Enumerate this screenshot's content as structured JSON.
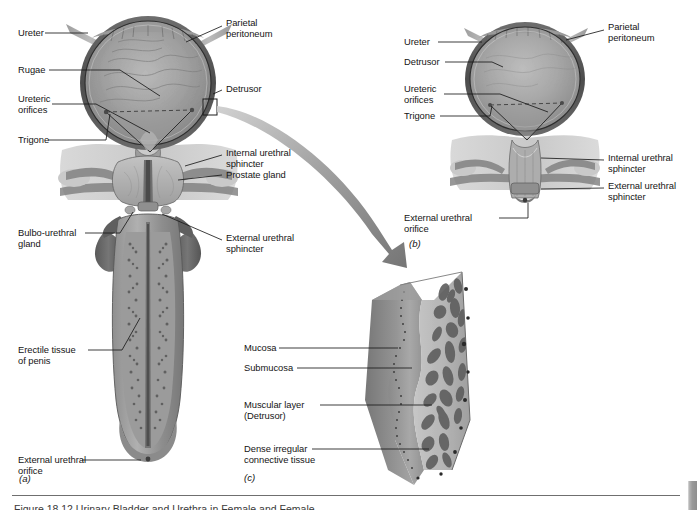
{
  "figure": {
    "background_color": "#ffffff",
    "ink_color": "#151515",
    "leader_color": "#1b1b1b",
    "arrow_color": "#8c8c8c"
  },
  "panel_a": {
    "letter": "(a)",
    "description": "Male urinary bladder with prostate gland and longitudinal section of penis",
    "labels_left": [
      {
        "id": "ureter",
        "text": "Ureter"
      },
      {
        "id": "rugae",
        "text": "Rugae"
      },
      {
        "id": "ureteric-orifices",
        "text": "Ureteric\norifices"
      },
      {
        "id": "trigone",
        "text": "Trigone"
      },
      {
        "id": "bulbo-urethral-gland",
        "text": "Bulbo-urethral\ngland"
      },
      {
        "id": "erectile-tissue",
        "text": "Erectile tissue\nof penis"
      },
      {
        "id": "external-urethral-orifice",
        "text": "External urethral\norifice"
      }
    ],
    "labels_right": [
      {
        "id": "parietal-peritoneum",
        "text": "Parietal\nperitoneum"
      },
      {
        "id": "detrusor",
        "text": "Detrusor"
      },
      {
        "id": "internal-urethral-sphincter",
        "text": "Internal urethral\nsphincter"
      },
      {
        "id": "prostate-gland",
        "text": "Prostate gland"
      },
      {
        "id": "external-urethral-sphincter",
        "text": "External urethral\nsphincter"
      }
    ]
  },
  "panel_b": {
    "letter": "(b)",
    "description": "Female urinary bladder",
    "labels_left": [
      {
        "id": "ureter",
        "text": "Ureter"
      },
      {
        "id": "detrusor",
        "text": "Detrusor"
      },
      {
        "id": "ureteric-orifices",
        "text": "Ureteric\norifices"
      },
      {
        "id": "trigone",
        "text": "Trigone"
      },
      {
        "id": "external-urethral-orifice",
        "text": "External urethral\norifice"
      }
    ],
    "labels_right": [
      {
        "id": "parietal-peritoneum",
        "text": "Parietal\nperitoneum"
      },
      {
        "id": "internal-urethral-sphincter",
        "text": "Internal urethral\nsphincter"
      },
      {
        "id": "external-urethral-sphincter",
        "text": "External urethral\nsphincter"
      }
    ]
  },
  "panel_c": {
    "letter": "(c)",
    "description": "Magnified wedge of bladder wall showing tissue layers",
    "labels_left": [
      {
        "id": "mucosa",
        "text": "Mucosa"
      },
      {
        "id": "submucosa",
        "text": "Submucosa"
      },
      {
        "id": "muscular-layer",
        "text": "Muscular layer\n(Detrusor)"
      },
      {
        "id": "dense-irregular-connective-tissue",
        "text": "Dense irregular\nconnective tissue"
      }
    ]
  },
  "callout": {
    "id": "magnification-arrow",
    "description": "Curved tapered arrow from boxed region of bladder wall in panel (a) to panel (c)"
  },
  "footer": {
    "rule": true,
    "caption_partial": "Figure 18.12    Urinary Bladder and Urethra in Female and Female"
  }
}
